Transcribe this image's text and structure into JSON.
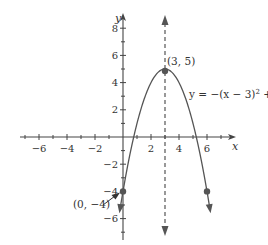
{
  "chart_data": {
    "type": "line",
    "title": "",
    "equation": "y = −(x − 3)² + 5",
    "equation_label": "y = −(x − 3)",
    "equation_exp": "2",
    "equation_tail": " + 5",
    "xlabel": "x",
    "ylabel": "y",
    "xlim": [
      -8,
      8
    ],
    "ylim": [
      -7,
      9
    ],
    "grid": false,
    "x_ticks": [
      -6,
      -4,
      -2,
      2,
      4,
      6
    ],
    "x_tick_labels": [
      "−6",
      "−4",
      "−2",
      "2",
      "4",
      "6"
    ],
    "y_ticks": [
      8,
      6,
      4,
      2,
      -2,
      -4,
      -6
    ],
    "y_tick_labels": [
      "8",
      "6",
      "4",
      "2",
      "−2",
      "−4",
      "−6"
    ],
    "axis_of_symmetry": {
      "x": 3,
      "style": "dashed"
    },
    "series": [
      {
        "name": "y = −(x − 3)² + 5",
        "function": "-(x-3)^2+5",
        "x": [
          -0.3,
          0,
          1,
          2,
          3,
          4,
          5,
          6,
          6.3
        ],
        "y": [
          -5.89,
          -4,
          1,
          4,
          5,
          4,
          1,
          -4,
          -5.89
        ]
      }
    ],
    "points": [
      {
        "x": 3,
        "y": 5,
        "label": "(3, 5)"
      },
      {
        "x": 0,
        "y": -4,
        "label": "(0, −4)"
      },
      {
        "x": 6,
        "y": -4,
        "label": ""
      }
    ],
    "annotations": [
      {
        "text": "(3, 5)",
        "target": "vertex"
      },
      {
        "text": "(0, −4)",
        "target": "y-intercept",
        "arrow": true
      }
    ]
  }
}
